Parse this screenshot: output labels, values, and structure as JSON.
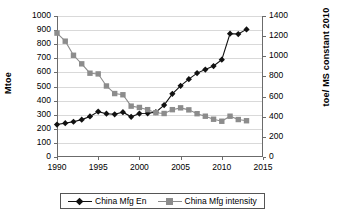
{
  "chart_data": {
    "type": "line",
    "title": "",
    "xlabel": "",
    "ylabel": "Mtoe",
    "y2label": "toe/ MS constant 2010",
    "grid": true,
    "legend_position": "bottom",
    "xlim": [
      1990,
      2015
    ],
    "xticks": [
      1990,
      1995,
      2000,
      2005,
      2010,
      2015
    ],
    "ylim": [
      0,
      1000
    ],
    "yticks": [
      0,
      100,
      200,
      300,
      400,
      500,
      600,
      700,
      800,
      900,
      1000
    ],
    "y2lim": [
      0,
      1400
    ],
    "y2ticks": [
      0,
      200,
      400,
      600,
      800,
      1000,
      1200,
      1400
    ],
    "x": [
      1990,
      1991,
      1992,
      1993,
      1994,
      1995,
      1996,
      1997,
      1998,
      1999,
      2000,
      2001,
      2002,
      2003,
      2004,
      2005,
      2006,
      2007,
      2008,
      2009,
      2010,
      2011,
      2012,
      2013
    ],
    "series": [
      {
        "name": "China Mfg En",
        "axis": "left",
        "color": "#111111",
        "marker": "diamond",
        "values": [
          230,
          240,
          250,
          265,
          288,
          322,
          307,
          303,
          318,
          285,
          308,
          310,
          318,
          368,
          448,
          505,
          552,
          595,
          620,
          645,
          690,
          875,
          872,
          905
        ]
      },
      {
        "name": "China Mfg intensity",
        "axis": "right",
        "color": "#8c8c8c",
        "marker": "square",
        "values": [
          1230,
          1150,
          1010,
          925,
          832,
          825,
          705,
          630,
          618,
          505,
          492,
          470,
          440,
          432,
          470,
          488,
          468,
          430,
          405,
          375,
          355,
          405,
          372,
          360
        ]
      }
    ]
  },
  "legend": {
    "items": [
      {
        "label": "China Mfg En",
        "color": "#111111",
        "marker": "diamond"
      },
      {
        "label": "China Mfg intensity",
        "color": "#8c8c8c",
        "marker": "square"
      }
    ]
  }
}
